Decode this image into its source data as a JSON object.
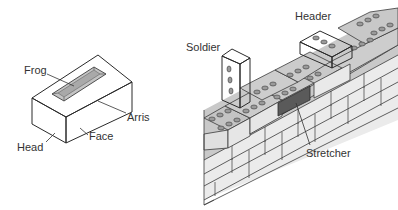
{
  "diagram": {
    "colors": {
      "background": "#ffffff",
      "brick_light": "#e6e6e6",
      "brick_top": "#cfcfcf",
      "brick_mid": "#bdbdbd",
      "brick_dark": "#5a5a5a",
      "frog": "#b8b8b8",
      "outline": "#2a2a2a",
      "label": "#333333"
    },
    "single_brick": {
      "labels": {
        "frog": "Frog",
        "arris": "Arris",
        "face": "Face",
        "head": "Head"
      }
    },
    "wall": {
      "labels": {
        "soldier": "Soldier",
        "header": "Header",
        "stretcher": "Stretcher"
      }
    }
  }
}
